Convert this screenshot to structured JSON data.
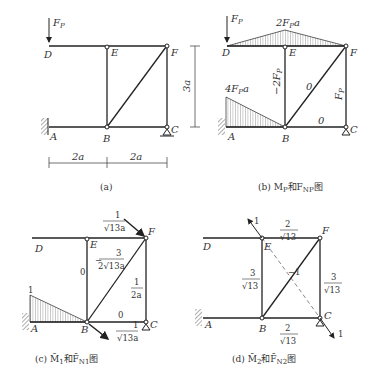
{
  "panels": [
    {
      "id": "a",
      "caption": "(a)",
      "nodes": {
        "D": "D",
        "E": "E",
        "F": "F",
        "A": "A",
        "B": "B",
        "C": "C"
      },
      "load": "F_P",
      "dims": {
        "left": "2a",
        "right": "2a",
        "height": "3a"
      }
    },
    {
      "id": "b",
      "caption": "(b) M_P和F_NP图",
      "load": "F_P",
      "moment_labels": {
        "top": "2F_Pa",
        "left": "4F_Pa"
      },
      "member_forces": {
        "EB": "−2F_P",
        "BF": "0",
        "BC": "0",
        "FC": "F_P"
      }
    },
    {
      "id": "c",
      "caption": "(c) M̄1和F̄N1图",
      "moment_label": "1",
      "member_forces": {
        "EB": "0",
        "BF": "−3/(2√13a)",
        "BC": "0",
        "FC": "1/(2a)"
      },
      "unit_loads": {
        "F": "1/(√13a)",
        "B": "1/(√13a)"
      }
    },
    {
      "id": "d",
      "caption": "(d) M̄2和F̄N2图",
      "member_forces": {
        "EF": "2/√13",
        "EB": "3/√13",
        "BF": "−1",
        "FC": "3/√13",
        "BC": "2/√13"
      },
      "unit_loads": {
        "E": "1",
        "C": "1"
      }
    }
  ]
}
